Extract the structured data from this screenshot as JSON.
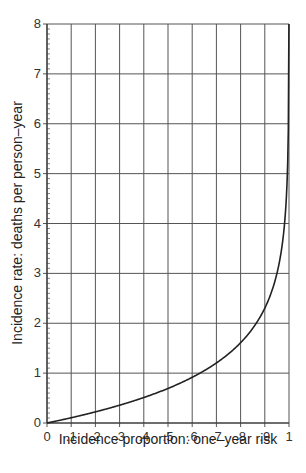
{
  "chart_data": {
    "type": "line",
    "title": "",
    "xlabel": "Incidence proportion: one–year risk",
    "ylabel": "Incidence rate: deaths per person–year",
    "xlim": [
      0,
      1
    ],
    "ylim": [
      0,
      8
    ],
    "grid": true,
    "legend": null,
    "x_ticks": [
      0,
      0.1,
      0.2,
      0.3,
      0.4,
      0.5,
      0.6,
      0.7,
      0.8,
      0.9,
      1
    ],
    "x_tick_labels": [
      "0",
      ".1",
      ".2",
      ".3",
      ".4",
      ".5",
      ".6",
      ".7",
      ".8",
      ".9",
      "1"
    ],
    "y_ticks": [
      0,
      1,
      2,
      3,
      4,
      5,
      6,
      7,
      8
    ],
    "y_tick_labels": [
      "0",
      "1",
      "2",
      "3",
      "4",
      "5",
      "6",
      "7",
      "8"
    ],
    "y_minor_ticks_per_major": 10,
    "series": [
      {
        "name": "rate = -ln(1 - risk)",
        "x": [
          0,
          0.1,
          0.2,
          0.3,
          0.4,
          0.5,
          0.6,
          0.7,
          0.8,
          0.9,
          0.95,
          0.98,
          0.99,
          0.995,
          0.999,
          0.99966
        ],
        "values": [
          0,
          0.105,
          0.223,
          0.357,
          0.511,
          0.693,
          0.916,
          1.204,
          1.609,
          2.303,
          2.996,
          3.912,
          4.605,
          5.298,
          6.908,
          8.0
        ]
      }
    ]
  },
  "colors": {
    "line": "#222222",
    "grid": "#555555",
    "background": "#ffffff"
  }
}
